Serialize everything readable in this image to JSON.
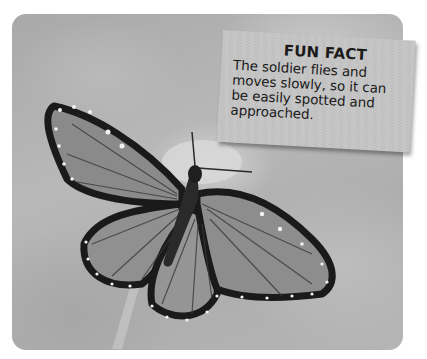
{
  "fun_fact": {
    "title": "FUN FACT",
    "body": "The soldier flies and moves slowly, so it can be easily spotted and approached."
  },
  "photo": {
    "subject": "butterfly",
    "description": "Soldier butterfly with spread wings perched on a flower, grayscale photo"
  },
  "colors": {
    "card_background": "#c6c6c6",
    "text": "#1a1a1a",
    "page_background": "#ffffff"
  }
}
